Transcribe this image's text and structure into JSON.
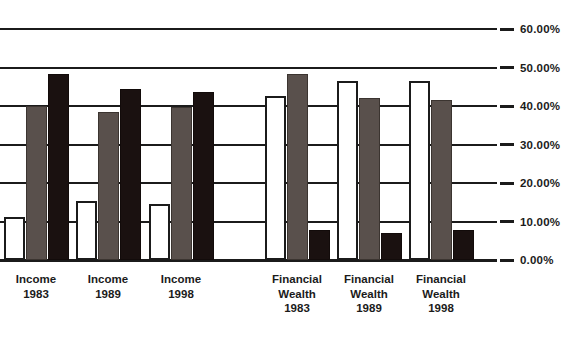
{
  "chart_data": {
    "type": "bar",
    "title": "",
    "subtitle": "",
    "xlabel": "",
    "ylabel": "",
    "ylim": [
      0,
      60
    ],
    "grid": true,
    "legend_position": "none",
    "categories": [
      "Income\n1983",
      "Income\n1989",
      "Income\n1998",
      "Financial\nWealth\n1983",
      "Financial\nWealth\n1989",
      "Financial\nWealth\n1998"
    ],
    "ytick_labels": [
      "60.00%",
      "50.00%",
      "40.00%",
      "30.00%",
      "20.00%",
      "10.00%",
      "0.00%"
    ],
    "ytick_values": [
      60,
      50,
      40,
      30,
      20,
      10,
      0
    ],
    "series": [
      {
        "name": "series-white",
        "color": "#ffffff",
        "values": [
          11.3,
          15.2,
          14.5,
          42.6,
          46.4,
          46.6
        ]
      },
      {
        "name": "series-gray",
        "color": "#59504c",
        "values": [
          40.0,
          38.5,
          39.8,
          48.4,
          42.0,
          41.5
        ]
      },
      {
        "name": "series-black",
        "color": "#1a1110",
        "values": [
          48.3,
          44.5,
          43.7,
          7.8,
          7.0,
          7.8
        ]
      }
    ]
  },
  "axis": {
    "line_color": "#1b1b1b"
  }
}
